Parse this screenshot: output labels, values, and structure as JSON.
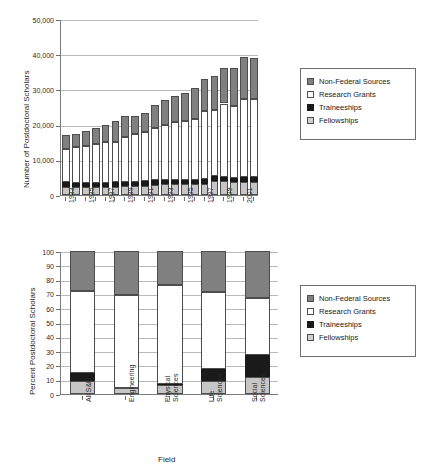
{
  "chart_data": [
    {
      "type": "bar",
      "id": "postdocs-by-year",
      "title": "",
      "stacked": true,
      "xlabel": "",
      "ylabel": "Number of Postdoctoral Scholars",
      "ylim": [
        0,
        50000
      ],
      "yticks": [
        0,
        10000,
        20000,
        30000,
        40000,
        50000
      ],
      "ytick_labels": [
        "0",
        "10,000",
        "20,000",
        "30,000",
        "40,000",
        "50,000"
      ],
      "grid": true,
      "legend_position": "right",
      "categories": [
        "1983",
        "1984",
        "1985",
        "1986",
        "1987",
        "1988",
        "1989",
        "1990",
        "1991",
        "1992",
        "1993",
        "1994",
        "1995",
        "1996",
        "1997",
        "1998",
        "1999",
        "2000",
        "2001",
        "2002"
      ],
      "visible_tick_labels": [
        "1983",
        "1985",
        "1987",
        "1989",
        "1991",
        "1993",
        "1995",
        "1997",
        "1999",
        "2001"
      ],
      "series": [
        {
          "name": "Fellowships",
          "color": "#c6c6c6",
          "values": [
            2300,
            2300,
            2300,
            2300,
            2300,
            2400,
            2500,
            2600,
            2700,
            2900,
            3000,
            3000,
            3100,
            3100,
            3200,
            3900,
            3900,
            3700,
            3700,
            3800
          ]
        },
        {
          "name": "Traineeships",
          "color": "#1a1a1a",
          "values": [
            1300,
            1200,
            1200,
            1200,
            1200,
            1200,
            1200,
            1200,
            1300,
            1300,
            1300,
            1300,
            1300,
            1300,
            1300,
            1400,
            1300,
            1200,
            1300,
            1300
          ]
        },
        {
          "name": "Research Grants",
          "color": "#ffffff",
          "values": [
            9400,
            10200,
            10300,
            10900,
            11500,
            11600,
            12900,
            13500,
            14000,
            14900,
            15700,
            16400,
            16600,
            17200,
            19400,
            18900,
            20800,
            20500,
            22400,
            22100
          ]
        },
        {
          "name": "Non-Federal Sources",
          "color": "#808080",
          "values": [
            4000,
            3600,
            4300,
            4700,
            5000,
            5800,
            5900,
            5200,
            5400,
            6600,
            7000,
            7500,
            8100,
            8700,
            9200,
            9600,
            10000,
            10800,
            11800,
            11800
          ]
        }
      ],
      "totals": [
        17000,
        17300,
        18100,
        19100,
        20000,
        21000,
        22500,
        22500,
        23400,
        25700,
        27000,
        28200,
        29100,
        30300,
        33100,
        33800,
        36000,
        36200,
        39200,
        39000
      ]
    },
    {
      "type": "bar",
      "id": "postdocs-by-field-percent",
      "title": "",
      "stacked": true,
      "xlabel": "Field",
      "ylabel": "Percent Postdoctoral Scholars",
      "ylim": [
        0,
        100
      ],
      "yticks": [
        0,
        10,
        20,
        30,
        40,
        50,
        60,
        70,
        80,
        90,
        100
      ],
      "ytick_labels": [
        "0",
        "10",
        "20",
        "30",
        "40",
        "50",
        "60",
        "70",
        "80",
        "90",
        "100"
      ],
      "grid": true,
      "legend_position": "right",
      "categories": [
        "All S&E",
        "Engineering",
        "Physical Sciences",
        "Life Sciences",
        "Social Sciences"
      ],
      "series": [
        {
          "name": "Fellowships",
          "color": "#c6c6c6",
          "values": [
            9,
            4,
            6,
            9,
            12
          ]
        },
        {
          "name": "Traineeships",
          "color": "#1a1a1a",
          "values": [
            5.5,
            0.5,
            1,
            8.5,
            15
          ]
        },
        {
          "name": "Research Grants",
          "color": "#ffffff",
          "values": [
            57.5,
            65,
            69,
            53.5,
            40
          ]
        },
        {
          "name": "Non-Federal Sources",
          "color": "#808080",
          "values": [
            28,
            30.5,
            24,
            29,
            33
          ]
        }
      ]
    }
  ],
  "legend_top": {
    "entries": [
      {
        "label": "Non-Federal Sources",
        "swatch": "nonfed"
      },
      {
        "label": "Research Grants",
        "swatch": "grants"
      },
      {
        "label": "Traineeships",
        "swatch": "train"
      },
      {
        "label": "Fellowships",
        "swatch": "fellow"
      }
    ]
  },
  "legend_bottom": {
    "entries": [
      {
        "label": "Non-Federal Sources",
        "swatch": "nonfed"
      },
      {
        "label": "Research Grants",
        "swatch": "grants"
      },
      {
        "label": "Traineeships",
        "swatch": "train"
      },
      {
        "label": "Fellowships",
        "swatch": "fellow"
      }
    ]
  }
}
